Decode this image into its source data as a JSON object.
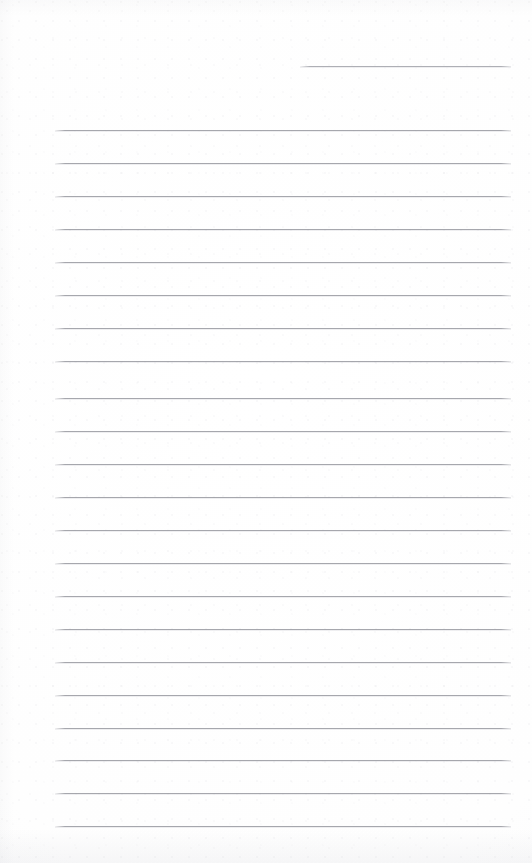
{
  "document": {
    "kind": "scanned-ruled-page",
    "title": "",
    "body_text": "",
    "page_width": 532,
    "page_height": 863,
    "paper_color": "#ffffff",
    "rule_color": "#a6a7ad",
    "header_rule_color": "#aeafb5"
  },
  "header": {
    "rule": {
      "label": "",
      "x": 300,
      "y": 66,
      "width": 211
    }
  },
  "ruled_lines": [
    {
      "label": "",
      "x": 55,
      "y": 130,
      "width": 456
    },
    {
      "label": "",
      "x": 55,
      "y": 163,
      "width": 456
    },
    {
      "label": "",
      "x": 55,
      "y": 196,
      "width": 456
    },
    {
      "label": "",
      "x": 55,
      "y": 229,
      "width": 456
    },
    {
      "label": "",
      "x": 55,
      "y": 262,
      "width": 456
    },
    {
      "label": "",
      "x": 55,
      "y": 295,
      "width": 456
    },
    {
      "label": "",
      "x": 55,
      "y": 328,
      "width": 456
    },
    {
      "label": "",
      "x": 55,
      "y": 361,
      "width": 456
    },
    {
      "label": "",
      "x": 55,
      "y": 398,
      "width": 456
    },
    {
      "label": "",
      "x": 55,
      "y": 431,
      "width": 456
    },
    {
      "label": "",
      "x": 55,
      "y": 464,
      "width": 456
    },
    {
      "label": "",
      "x": 55,
      "y": 497,
      "width": 456
    },
    {
      "label": "",
      "x": 55,
      "y": 530,
      "width": 456
    },
    {
      "label": "",
      "x": 55,
      "y": 563,
      "width": 456
    },
    {
      "label": "",
      "x": 55,
      "y": 596,
      "width": 456
    },
    {
      "label": "",
      "x": 55,
      "y": 629,
      "width": 456
    },
    {
      "label": "",
      "x": 55,
      "y": 662,
      "width": 456
    },
    {
      "label": "",
      "x": 55,
      "y": 695,
      "width": 456
    },
    {
      "label": "",
      "x": 55,
      "y": 728,
      "width": 456
    },
    {
      "label": "",
      "x": 55,
      "y": 760,
      "width": 456
    },
    {
      "label": "",
      "x": 55,
      "y": 793,
      "width": 456
    },
    {
      "label": "",
      "x": 55,
      "y": 826,
      "width": 456
    }
  ]
}
